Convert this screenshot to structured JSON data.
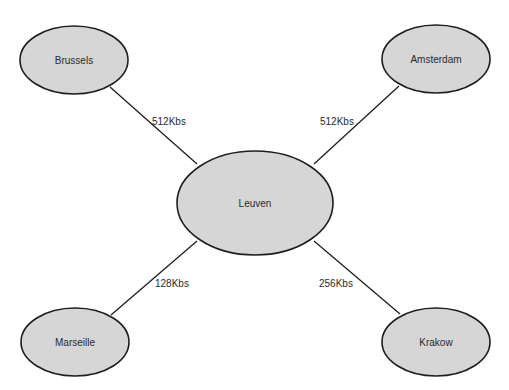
{
  "diagram": {
    "type": "network-topology",
    "hub": {
      "id": "leuven",
      "label": "Leuven"
    },
    "nodes": [
      {
        "id": "leuven",
        "label": "Leuven"
      },
      {
        "id": "brussels",
        "label": "Brussels"
      },
      {
        "id": "amsterdam",
        "label": "Amsterdam"
      },
      {
        "id": "marseille",
        "label": "Marseille"
      },
      {
        "id": "krakow",
        "label": "Krakow"
      }
    ],
    "links": [
      {
        "from": "brussels",
        "to": "leuven",
        "label": "512Kbs"
      },
      {
        "from": "amsterdam",
        "to": "leuven",
        "label": "512Kbs"
      },
      {
        "from": "marseille",
        "to": "leuven",
        "label": "128Kbs"
      },
      {
        "from": "krakow",
        "to": "leuven",
        "label": "256Kbs"
      }
    ]
  },
  "colors": {
    "node_fill": "#d6d6d6",
    "stroke": "#1e1e1e",
    "text": "#2a2a2a",
    "background": "#ffffff"
  }
}
